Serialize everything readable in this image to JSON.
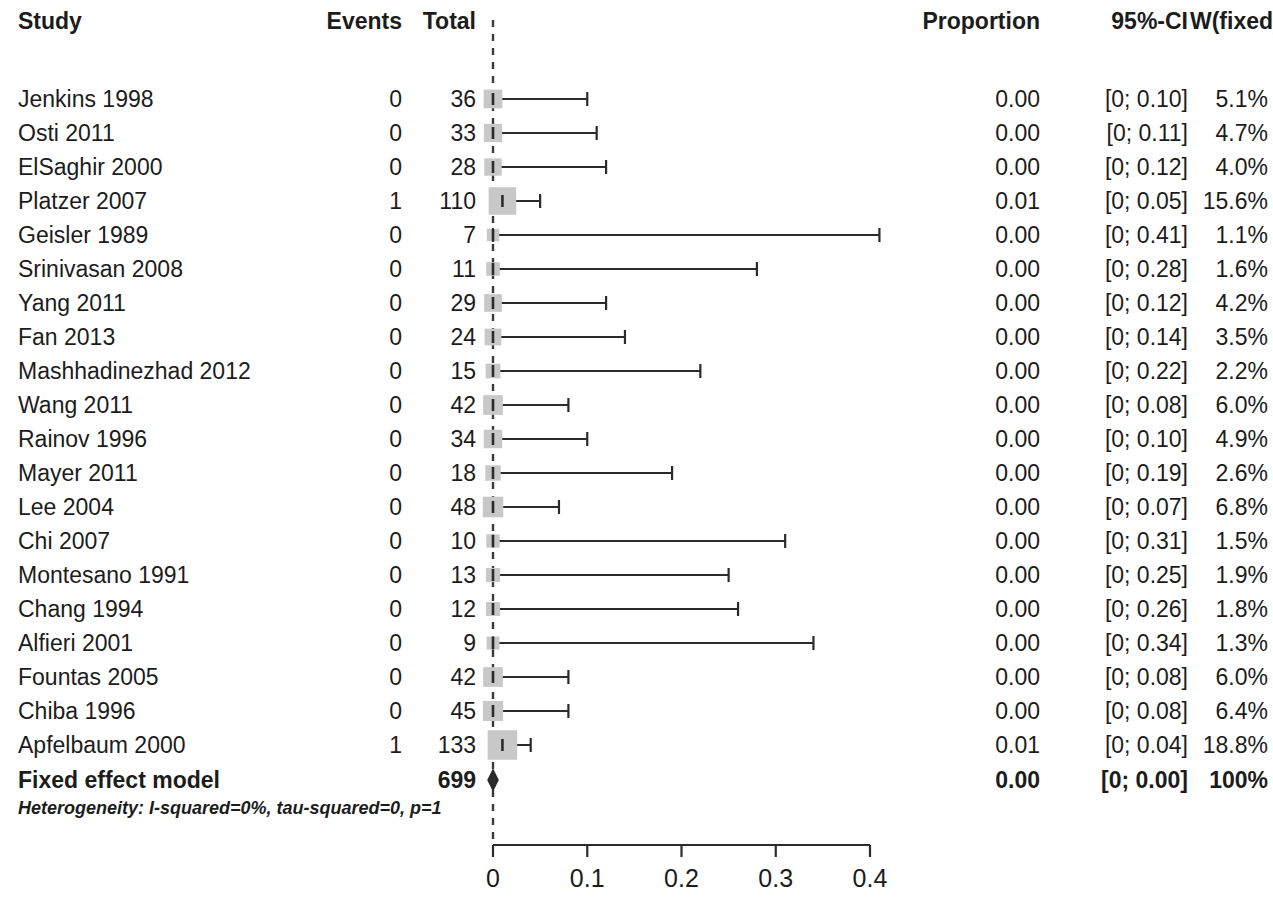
{
  "header": {
    "study": "Study",
    "events": "Events",
    "total": "Total",
    "proportion": "Proportion",
    "ci": "95%-CI",
    "weight": "W(fixed)"
  },
  "summary": {
    "label": "Fixed effect model",
    "events": "",
    "total": "699",
    "proportion": "0.00",
    "ci": "[0; 0.00]",
    "weight": "100%"
  },
  "heterogeneity": "Heterogeneity: I-squared=0%, tau-squared=0, p=1",
  "axis": {
    "ticks": [
      "0",
      "0.1",
      "0.2",
      "0.3",
      "0.4"
    ],
    "min": 0,
    "max": 0.4
  },
  "colors": {
    "text": "#1c1c1c",
    "line": "#2b2b2b",
    "marker": "#c8c8c8",
    "reference": "#3a3a3a"
  },
  "rows": [
    {
      "study": "Jenkins 1998",
      "events": "0",
      "total": "36",
      "proportion": "0.00",
      "ci": "[0; 0.10]",
      "weight": "5.1%",
      "est": 0.0,
      "lo": 0.0,
      "hi": 0.1,
      "w": 5.1
    },
    {
      "study": "Osti 2011",
      "events": "0",
      "total": "33",
      "proportion": "0.00",
      "ci": "[0; 0.11]",
      "weight": "4.7%",
      "est": 0.0,
      "lo": 0.0,
      "hi": 0.11,
      "w": 4.7
    },
    {
      "study": "ElSaghir 2000",
      "events": "0",
      "total": "28",
      "proportion": "0.00",
      "ci": "[0; 0.12]",
      "weight": "4.0%",
      "est": 0.0,
      "lo": 0.0,
      "hi": 0.12,
      "w": 4.0
    },
    {
      "study": "Platzer 2007",
      "events": "1",
      "total": "110",
      "proportion": "0.01",
      "ci": "[0; 0.05]",
      "weight": "15.6%",
      "est": 0.01,
      "lo": 0.0,
      "hi": 0.05,
      "w": 15.6
    },
    {
      "study": "Geisler 1989",
      "events": "0",
      "total": "7",
      "proportion": "0.00",
      "ci": "[0; 0.41]",
      "weight": "1.1%",
      "est": 0.0,
      "lo": 0.0,
      "hi": 0.41,
      "w": 1.1
    },
    {
      "study": "Srinivasan 2008",
      "events": "0",
      "total": "11",
      "proportion": "0.00",
      "ci": "[0; 0.28]",
      "weight": "1.6%",
      "est": 0.0,
      "lo": 0.0,
      "hi": 0.28,
      "w": 1.6
    },
    {
      "study": "Yang 2011",
      "events": "0",
      "total": "29",
      "proportion": "0.00",
      "ci": "[0; 0.12]",
      "weight": "4.2%",
      "est": 0.0,
      "lo": 0.0,
      "hi": 0.12,
      "w": 4.2
    },
    {
      "study": "Fan 2013",
      "events": "0",
      "total": "24",
      "proportion": "0.00",
      "ci": "[0; 0.14]",
      "weight": "3.5%",
      "est": 0.0,
      "lo": 0.0,
      "hi": 0.14,
      "w": 3.5
    },
    {
      "study": "Mashhadinezhad 2012",
      "events": "0",
      "total": "15",
      "proportion": "0.00",
      "ci": "[0; 0.22]",
      "weight": "2.2%",
      "est": 0.0,
      "lo": 0.0,
      "hi": 0.22,
      "w": 2.2
    },
    {
      "study": "Wang 2011",
      "events": "0",
      "total": "42",
      "proportion": "0.00",
      "ci": "[0; 0.08]",
      "weight": "6.0%",
      "est": 0.0,
      "lo": 0.0,
      "hi": 0.08,
      "w": 6.0
    },
    {
      "study": "Rainov 1996",
      "events": "0",
      "total": "34",
      "proportion": "0.00",
      "ci": "[0; 0.10]",
      "weight": "4.9%",
      "est": 0.0,
      "lo": 0.0,
      "hi": 0.1,
      "w": 4.9
    },
    {
      "study": "Mayer 2011",
      "events": "0",
      "total": "18",
      "proportion": "0.00",
      "ci": "[0; 0.19]",
      "weight": "2.6%",
      "est": 0.0,
      "lo": 0.0,
      "hi": 0.19,
      "w": 2.6
    },
    {
      "study": "Lee 2004",
      "events": "0",
      "total": "48",
      "proportion": "0.00",
      "ci": "[0; 0.07]",
      "weight": "6.8%",
      "est": 0.0,
      "lo": 0.0,
      "hi": 0.07,
      "w": 6.8
    },
    {
      "study": "Chi 2007",
      "events": "0",
      "total": "10",
      "proportion": "0.00",
      "ci": "[0; 0.31]",
      "weight": "1.5%",
      "est": 0.0,
      "lo": 0.0,
      "hi": 0.31,
      "w": 1.5
    },
    {
      "study": "Montesano 1991",
      "events": "0",
      "total": "13",
      "proportion": "0.00",
      "ci": "[0; 0.25]",
      "weight": "1.9%",
      "est": 0.0,
      "lo": 0.0,
      "hi": 0.25,
      "w": 1.9
    },
    {
      "study": "Chang 1994",
      "events": "0",
      "total": "12",
      "proportion": "0.00",
      "ci": "[0; 0.26]",
      "weight": "1.8%",
      "est": 0.0,
      "lo": 0.0,
      "hi": 0.26,
      "w": 1.8
    },
    {
      "study": "Alfieri 2001",
      "events": "0",
      "total": "9",
      "proportion": "0.00",
      "ci": "[0; 0.34]",
      "weight": "1.3%",
      "est": 0.0,
      "lo": 0.0,
      "hi": 0.34,
      "w": 1.3
    },
    {
      "study": "Fountas 2005",
      "events": "0",
      "total": "42",
      "proportion": "0.00",
      "ci": "[0; 0.08]",
      "weight": "6.0%",
      "est": 0.0,
      "lo": 0.0,
      "hi": 0.08,
      "w": 6.0
    },
    {
      "study": "Chiba 1996",
      "events": "0",
      "total": "45",
      "proportion": "0.00",
      "ci": "[0; 0.08]",
      "weight": "6.4%",
      "est": 0.0,
      "lo": 0.0,
      "hi": 0.08,
      "w": 6.4
    },
    {
      "study": "Apfelbaum 2000",
      "events": "1",
      "total": "133",
      "proportion": "0.01",
      "ci": "[0; 0.04]",
      "weight": "18.8%",
      "est": 0.01,
      "lo": 0.0,
      "hi": 0.04,
      "w": 18.8
    }
  ],
  "chart_data": {
    "type": "forest",
    "title": "",
    "xlabel": "",
    "ylabel": "",
    "xlim": [
      0,
      0.4
    ],
    "xticks": [
      0,
      0.1,
      0.2,
      0.3,
      0.4
    ],
    "grid": false,
    "legend": "none",
    "reference_line": 0,
    "effect_measure": "Proportion",
    "model": "Fixed effect",
    "columns": [
      "Study",
      "Events",
      "Total",
      "Proportion",
      "95%-CI",
      "W(fixed)"
    ],
    "categories": [
      "Jenkins 1998",
      "Osti 2011",
      "ElSaghir 2000",
      "Platzer 2007",
      "Geisler 1989",
      "Srinivasan 2008",
      "Yang 2011",
      "Fan 2013",
      "Mashhadinezhad 2012",
      "Wang 2011",
      "Rainov 1996",
      "Mayer 2011",
      "Lee 2004",
      "Chi 2007",
      "Montesano 1991",
      "Chang 1994",
      "Alfieri 2001",
      "Fountas 2005",
      "Chiba 1996",
      "Apfelbaum 2000"
    ],
    "events": [
      0,
      0,
      0,
      1,
      0,
      0,
      0,
      0,
      0,
      0,
      0,
      0,
      0,
      0,
      0,
      0,
      0,
      0,
      0,
      1
    ],
    "totals": [
      36,
      33,
      28,
      110,
      7,
      11,
      29,
      24,
      15,
      42,
      34,
      18,
      48,
      10,
      13,
      12,
      9,
      42,
      45,
      133
    ],
    "values": [
      0.0,
      0.0,
      0.0,
      0.01,
      0.0,
      0.0,
      0.0,
      0.0,
      0.0,
      0.0,
      0.0,
      0.0,
      0.0,
      0.0,
      0.0,
      0.0,
      0.0,
      0.0,
      0.0,
      0.01
    ],
    "ci_lower": [
      0,
      0,
      0,
      0,
      0,
      0,
      0,
      0,
      0,
      0,
      0,
      0,
      0,
      0,
      0,
      0,
      0,
      0,
      0,
      0
    ],
    "ci_upper": [
      0.1,
      0.11,
      0.12,
      0.05,
      0.41,
      0.28,
      0.12,
      0.14,
      0.22,
      0.08,
      0.1,
      0.19,
      0.07,
      0.31,
      0.25,
      0.26,
      0.34,
      0.08,
      0.08,
      0.04
    ],
    "weights": [
      5.1,
      4.7,
      4.0,
      15.6,
      1.1,
      1.6,
      4.2,
      3.5,
      2.2,
      6.0,
      4.9,
      2.6,
      6.8,
      1.5,
      1.9,
      1.8,
      1.3,
      6.0,
      6.4,
      18.8
    ],
    "summary": {
      "label": "Fixed effect model",
      "total": 699,
      "value": 0.0,
      "ci_lower": 0,
      "ci_upper": 0.0,
      "weight": "100%"
    },
    "heterogeneity": {
      "I_squared": "0%",
      "tau_squared": "0",
      "p": "1"
    }
  }
}
